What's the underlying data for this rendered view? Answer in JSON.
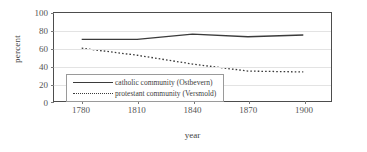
{
  "chart_data": {
    "type": "line",
    "title": "",
    "xlabel": "year",
    "ylabel": "percent",
    "x": [
      1780,
      1810,
      1840,
      1870,
      1900
    ],
    "xticklabels": [
      "1780",
      "1810",
      "1840",
      "1870",
      "1900"
    ],
    "yticklabels": [
      "0",
      "20",
      "40",
      "60",
      "80",
      "100"
    ],
    "yticks": [
      0,
      20,
      40,
      60,
      80,
      100
    ],
    "ylim": [
      0,
      100
    ],
    "xlim": [
      1765,
      1915
    ],
    "grid": "horizontal",
    "legend_position": "lower-left-inside",
    "series": [
      {
        "name": "catholic community (Ostbevern)",
        "style": "solid",
        "color": "#3b3b3b",
        "values": [
          70,
          70,
          76,
          73,
          75
        ]
      },
      {
        "name": "protestant community (Versmold)",
        "style": "dotted",
        "color": "#3b3b3b",
        "values": [
          60,
          52,
          42,
          34,
          33
        ]
      }
    ]
  },
  "legend": {
    "entries": [
      {
        "label": "catholic community (Ostbevern)"
      },
      {
        "label": "protestant community (Versmold)"
      }
    ]
  }
}
